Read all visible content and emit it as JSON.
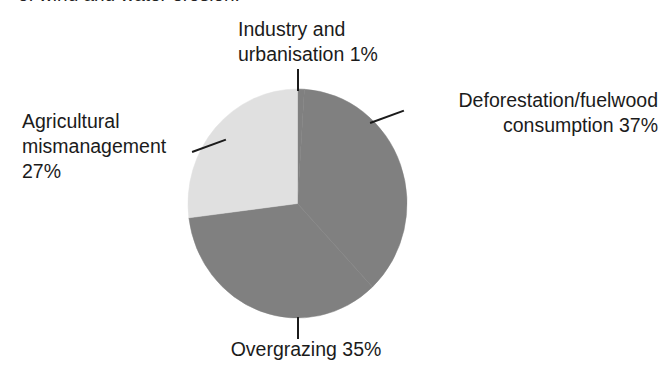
{
  "caption": {
    "text": "of wind and water erosion."
  },
  "colors": {
    "slice_dark": "#808080",
    "slice_light": "#e0e0e0",
    "text": "#1b1b1b",
    "background": "#ffffff",
    "leader_line": "#1b1b1b"
  },
  "labels": {
    "industry": "Industry and\nurbanisation 1%",
    "deforestation": "Deforestation/fuelwood\nconsumption 37%",
    "agricultural": "Agricultural\nmismanagement\n27%",
    "overgrazing": "Overgrazing 35%"
  },
  "chart_data": {
    "type": "pie",
    "title": "",
    "xlabel": "",
    "ylabel": "",
    "legend_position": "none",
    "grid": false,
    "start_angle_deg": 0,
    "direction": "clockwise",
    "categories": [
      "Industry and urbanisation",
      "Deforestation/fuelwood consumption",
      "Overgrazing",
      "Agricultural mismanagement"
    ],
    "values": [
      1,
      37,
      35,
      27
    ],
    "unit": "%",
    "slices": [
      {
        "label": "Industry and urbanisation",
        "value": 1,
        "display": "Industry and urbanisation 1%",
        "color": "#808080",
        "start_deg": 0,
        "end_deg": 3.6
      },
      {
        "label": "Deforestation/fuelwood consumption",
        "value": 37,
        "display": "Deforestation/fuelwood consumption 37%",
        "color": "#808080",
        "start_deg": 3.6,
        "end_deg": 136.8
      },
      {
        "label": "Overgrazing",
        "value": 35,
        "display": "Overgrazing 35%",
        "color": "#808080",
        "start_deg": 136.8,
        "end_deg": 262.8
      },
      {
        "label": "Agricultural mismanagement",
        "value": 27,
        "display": "Agricultural mismanagement 27%",
        "color": "#e0e0e0",
        "start_deg": 262.8,
        "end_deg": 360
      }
    ]
  }
}
